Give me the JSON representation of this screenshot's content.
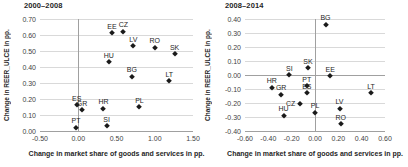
{
  "colors": {
    "marker": "#1a1a1a",
    "gridline": "#d9d9d9",
    "axis_line": "#a0a0a0",
    "tick_text": "#3f3f3f",
    "title_text": "#1f1f1f"
  },
  "chart_data": [
    {
      "type": "scatter",
      "title": "2000–2008",
      "xlabel": "Change in market share of goods and services in pp.",
      "ylabel": "Change in REER_ULCE in pp.",
      "xlim": [
        -0.5,
        1.5
      ],
      "ylim": [
        0.0,
        0.7
      ],
      "xtick_values": [
        -0.5,
        0.0,
        0.5,
        1.0,
        1.5
      ],
      "xtick_labels": [
        "-0.50",
        "0.00",
        "0.50",
        "1.00",
        "1.50"
      ],
      "ytick_values": [
        0.0,
        0.1,
        0.2,
        0.3,
        0.4,
        0.5,
        0.6,
        0.7
      ],
      "ytick_labels": [
        "0.00",
        "0.10",
        "0.20",
        "0.30",
        "0.40",
        "0.50",
        "0.60",
        "0.70"
      ],
      "grid": "horizontal gridlines, vertical line at x=0",
      "legend": "none",
      "points": [
        {
          "label": "EE",
          "x": 0.44,
          "y": 0.61
        },
        {
          "label": "CZ",
          "x": 0.59,
          "y": 0.62
        },
        {
          "label": "LV",
          "x": 0.72,
          "y": 0.53
        },
        {
          "label": "RO",
          "x": 1.0,
          "y": 0.52
        },
        {
          "label": "SK",
          "x": 1.26,
          "y": 0.48
        },
        {
          "label": "HU",
          "x": 0.4,
          "y": 0.43
        },
        {
          "label": "BG",
          "x": 0.7,
          "y": 0.34
        },
        {
          "label": "LT",
          "x": 1.19,
          "y": 0.31
        },
        {
          "label": "ES",
          "x": -0.02,
          "y": 0.16
        },
        {
          "label": "GR",
          "x": 0.05,
          "y": 0.13
        },
        {
          "label": "HR",
          "x": 0.33,
          "y": 0.14
        },
        {
          "label": "PL",
          "x": 0.8,
          "y": 0.15
        },
        {
          "label": "PT",
          "x": -0.03,
          "y": 0.02
        },
        {
          "label": "SI",
          "x": 0.37,
          "y": 0.03
        }
      ]
    },
    {
      "type": "scatter",
      "title": "2008–2014",
      "xlabel": "Change in market share of goods and services in pp.",
      "ylabel": "Change in REER_ULCE in pp.",
      "xlim": [
        -0.6,
        0.6
      ],
      "ylim": [
        -0.4,
        0.4
      ],
      "xtick_values": [
        -0.6,
        -0.4,
        -0.2,
        0.0,
        0.2,
        0.4,
        0.6
      ],
      "xtick_labels": [
        "-0.60",
        "-0.40",
        "-0.20",
        "0.00",
        "0.20",
        "0.40",
        "0.60"
      ],
      "ytick_values": [
        -0.4,
        -0.3,
        -0.2,
        -0.1,
        0.0,
        0.1,
        0.2,
        0.3,
        0.4
      ],
      "ytick_labels": [
        "-0.40",
        "-0.30",
        "-0.20",
        "-0.10",
        "0.00",
        "0.10",
        "0.20",
        "0.30",
        "0.40"
      ],
      "grid": "horizontal gridlines, vertical line at x=0, darker line at y=0",
      "legend": "none",
      "points": [
        {
          "label": "BG",
          "x": 0.09,
          "y": 0.36
        },
        {
          "label": "SK",
          "x": -0.06,
          "y": 0.05
        },
        {
          "label": "SI",
          "x": -0.22,
          "y": 0.0
        },
        {
          "label": "EE",
          "x": 0.13,
          "y": -0.01
        },
        {
          "label": "HR",
          "x": -0.37,
          "y": -0.09
        },
        {
          "label": "PT",
          "x": -0.07,
          "y": -0.08
        },
        {
          "label": "ES",
          "x": -0.07,
          "y": -0.13
        },
        {
          "label": "GR",
          "x": -0.29,
          "y": -0.14
        },
        {
          "label": "CZ",
          "x": -0.13,
          "y": -0.21,
          "lpos": "left"
        },
        {
          "label": "LT",
          "x": 0.48,
          "y": -0.13
        },
        {
          "label": "LV",
          "x": 0.21,
          "y": -0.24
        },
        {
          "label": "HU",
          "x": -0.27,
          "y": -0.29
        },
        {
          "label": "PL",
          "x": 0.0,
          "y": -0.27
        },
        {
          "label": "RO",
          "x": 0.22,
          "y": -0.35
        }
      ]
    }
  ]
}
